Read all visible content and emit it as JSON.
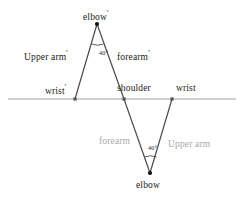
{
  "figure": {
    "colors": {
      "axis_line": "#a0a0a0",
      "limb_line": "#4a4a4a",
      "joint_dot": "#111111",
      "label_primary": "#1b1b1b",
      "label_secondary": "#a9a9a9"
    }
  },
  "labels": {
    "elbow_prime": "elbow",
    "elbow_prime_mark": "'",
    "upper_arm_prime": "Upper arm",
    "upper_arm_prime_mark": "'",
    "forearm_prime": "forearm",
    "forearm_prime_mark": "'",
    "wrist_prime": "wrist",
    "wrist_prime_mark": "'",
    "shoulder": "shoulder",
    "wrist": "wrist",
    "forearm": "forearm",
    "upper_arm": "Upper arm",
    "elbow": "elbow",
    "angle_top": "40°",
    "angle_bottom": "40°"
  },
  "geometry": {
    "axis": {
      "x1": 8,
      "y1": 99,
      "x2": 236,
      "y2": 99
    },
    "joints": [
      {
        "name": "wrist-prime",
        "x": 75,
        "y": 99
      },
      {
        "name": "elbow-prime",
        "x": 97,
        "y": 24
      },
      {
        "name": "shoulder",
        "x": 124,
        "y": 99
      },
      {
        "name": "elbow",
        "x": 150,
        "y": 173
      },
      {
        "name": "wrist",
        "x": 172,
        "y": 99
      }
    ],
    "segments": [
      {
        "name": "upper-arm-prime",
        "from": "wrist-prime",
        "to": "elbow-prime"
      },
      {
        "name": "forearm-prime",
        "from": "elbow-prime",
        "to": "shoulder"
      },
      {
        "name": "forearm",
        "from": "shoulder",
        "to": "elbow"
      },
      {
        "name": "upper-arm",
        "from": "elbow",
        "to": "wrist"
      }
    ],
    "angle_arcs": [
      {
        "name": "elbow-prime-angle",
        "vertex": "elbow-prime",
        "value_deg": 40
      },
      {
        "name": "elbow-angle",
        "vertex": "elbow",
        "value_deg": 40
      }
    ]
  }
}
